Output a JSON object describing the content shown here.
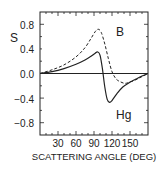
{
  "chart_data": {
    "type": "line",
    "title": "",
    "xlabel": "SCATTERING ANGLE (DEG)",
    "ylabel": "S",
    "xlim": [
      0,
      180
    ],
    "ylim": [
      -1.0,
      1.0
    ],
    "x_ticks": [
      "30",
      "60",
      "90",
      "120",
      "150"
    ],
    "y_ticks": [
      "0.8",
      "0.4",
      "0.0",
      "-0.4",
      "-0.8"
    ],
    "grid": false,
    "legend": "inline labels",
    "series": [
      {
        "name": "B",
        "style": "dashed",
        "x": [
          0,
          20,
          40,
          60,
          75,
          85,
          92,
          97,
          102,
          108,
          114,
          120,
          127,
          135,
          142,
          150,
          160,
          170,
          180
        ],
        "y": [
          0.0,
          0.06,
          0.14,
          0.27,
          0.42,
          0.57,
          0.68,
          0.72,
          0.67,
          0.48,
          0.24,
          0.03,
          -0.09,
          -0.14,
          -0.16,
          -0.14,
          -0.1,
          -0.05,
          0.0
        ]
      },
      {
        "name": "Hg",
        "style": "solid",
        "x": [
          0,
          20,
          40,
          60,
          75,
          85,
          92,
          96,
          100,
          104,
          108,
          112,
          116,
          120,
          128,
          138,
          150,
          160,
          170,
          180
        ],
        "y": [
          0.0,
          0.03,
          0.08,
          0.15,
          0.22,
          0.28,
          0.33,
          0.35,
          0.3,
          0.08,
          -0.22,
          -0.42,
          -0.47,
          -0.44,
          -0.33,
          -0.22,
          -0.14,
          -0.09,
          -0.04,
          0.0
        ]
      }
    ],
    "annotations": [
      {
        "text": "B",
        "x": 128,
        "y": 0.72
      },
      {
        "text": "Hg",
        "x": 130,
        "y": -0.74
      }
    ]
  },
  "labels": {
    "ylabel": "S",
    "xlabel": "SCATTERING ANGLE (DEG)",
    "series_b": "B",
    "series_hg": "Hg",
    "yt0": "0.8",
    "yt1": "0.4",
    "yt2": "0.0",
    "yt3": "−0.4",
    "yt4": "−0.8",
    "xt0": "30",
    "xt1": "60",
    "xt2": "90",
    "xt3": "120",
    "xt4": "150"
  }
}
